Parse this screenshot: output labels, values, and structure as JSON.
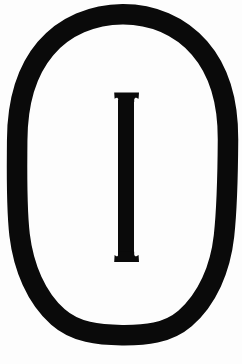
{
  "image": {
    "kind": "scanned-symbol",
    "description": "Capital letter I enclosed in an oval outline",
    "width": 242,
    "height": 364,
    "background_color": "#fdfdfd",
    "ink_color": "#0a0a0a"
  },
  "symbol": {
    "enclosing_shape_name": "oval",
    "enclosed_character": "I",
    "alt_text": "Letter I inside an oval"
  },
  "oval": {
    "name": "oval-outline",
    "center_x": 122.5,
    "center_y": 174.5,
    "outer_radius_x": 105.5,
    "outer_radius_y": 160.5,
    "stroke_width": 20,
    "stroke_color": "#0a0a0a",
    "fill": "none",
    "bounds": {
      "left": 17,
      "top": 14,
      "right": 228,
      "bottom": 335
    }
  },
  "letter": {
    "name": "letter-i",
    "character": "I",
    "style": "serif-slab",
    "color": "#0a0a0a",
    "stem_left": 118,
    "stem_right": 134,
    "stem_width": 16,
    "top": 92,
    "bottom": 262,
    "height": 170,
    "serif_left": 114,
    "serif_right": 139,
    "serif_height": 6
  }
}
